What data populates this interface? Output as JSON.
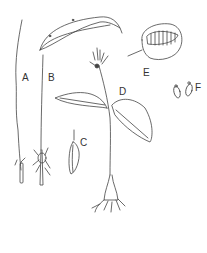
{
  "figure": {
    "panels": [
      {
        "label": "A",
        "subject": "seedling stem with root"
      },
      {
        "label": "B",
        "subject": "single leaf plant with bulb and roots"
      },
      {
        "label": "C",
        "subject": "corm/bulb detail"
      },
      {
        "label": "D",
        "subject": "flowering plant with two leaves and roots"
      },
      {
        "label": "E",
        "subject": "seed capsule, opened"
      },
      {
        "label": "F",
        "subject": "seeds"
      }
    ],
    "ink_color": "#333333",
    "background": "#ffffff"
  }
}
